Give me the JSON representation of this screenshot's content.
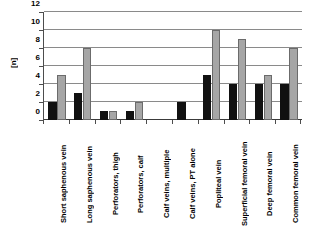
{
  "chart_data": {
    "type": "bar",
    "title": "",
    "subtitle": "",
    "xlabel": "",
    "ylabel": "[n]",
    "ylim": [
      0,
      12
    ],
    "ytick_step": 2,
    "yticks": [
      12,
      10,
      8,
      6,
      4,
      2,
      0
    ],
    "grid": true,
    "legend": "none",
    "categories": [
      "Short saphenous vein",
      "Long saphenous vein",
      "Perforators, thigh",
      "Perforators, calf",
      "Calf veins, multiple",
      "Calf veins, PT alone",
      "Popliteal vein",
      "Superficial femoral vein",
      "Deep femoral vein",
      "Common femoral vein"
    ],
    "series": [
      {
        "name": "series-dark",
        "color": "#111111",
        "values": [
          2,
          3,
          1,
          1,
          0,
          2,
          5,
          4,
          4,
          4
        ]
      },
      {
        "name": "series-light",
        "color": "#a6a6a6",
        "values": [
          5,
          8,
          1,
          2,
          0,
          0,
          10,
          9,
          5,
          8
        ]
      }
    ]
  },
  "colors": {
    "background": "#ffffff",
    "gridline": "#8a8a8a",
    "axis": "#4d4d4d",
    "text": "#000000",
    "bar_dark": "#111111",
    "bar_light": "#a6a6a6"
  }
}
